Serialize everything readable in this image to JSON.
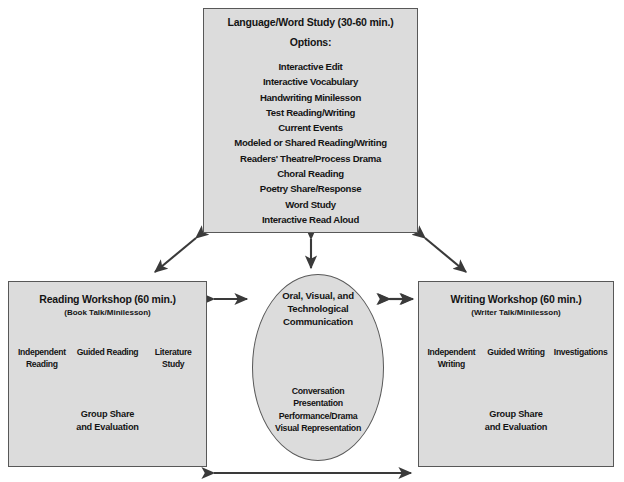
{
  "diagram": {
    "colors": {
      "box_fill": "#dcdcdc",
      "box_border": "#585858",
      "text": "#141414",
      "arrow": "#3a3a3a",
      "page_background": "#ffffff"
    }
  },
  "top_box": {
    "title": "Language/Word Study (30-60 min.)",
    "subtitle": "Options:",
    "options": [
      "Interactive Edit",
      "Interactive Vocabulary",
      "Handwriting Minilesson",
      "Test Reading/Writing",
      "Current Events",
      "Modeled or Shared Reading/Writing",
      "Readers' Theatre/Process Drama",
      "Choral Reading",
      "Poetry Share/Response",
      "Word Study",
      "Interactive Read Aloud"
    ]
  },
  "left_box": {
    "title": "Reading Workshop (60 min.)",
    "subtitle": "(Book Talk/Minilesson)",
    "branches": [
      "Independent\nReading",
      "Guided Reading",
      "Literature\nStudy"
    ],
    "outcome": "Group  Share\nand Evaluation"
  },
  "right_box": {
    "title": "Writing Workshop (60 min.)",
    "subtitle": "(Writer Talk/Minilesson)",
    "branches": [
      "Independent\nWriting",
      "Guided Writing",
      "Investigations"
    ],
    "outcome": "Group  Share\nand Evaluation"
  },
  "center_ellipse": {
    "title": "Oral, Visual, and\nTechnological\nCommunication",
    "items": [
      "Conversation",
      "Presentation",
      "Performance/Drama",
      "Visual Representation"
    ]
  },
  "connectors": [
    {
      "name": "top-to-left",
      "type": "double-headed-diagonal"
    },
    {
      "name": "top-to-right",
      "type": "double-headed-diagonal"
    },
    {
      "name": "top-to-center",
      "type": "double-headed-vertical"
    },
    {
      "name": "left-to-center",
      "type": "double-headed-horizontal"
    },
    {
      "name": "center-to-right",
      "type": "double-headed-horizontal"
    },
    {
      "name": "left-to-right-bottom",
      "type": "double-headed-horizontal"
    }
  ]
}
